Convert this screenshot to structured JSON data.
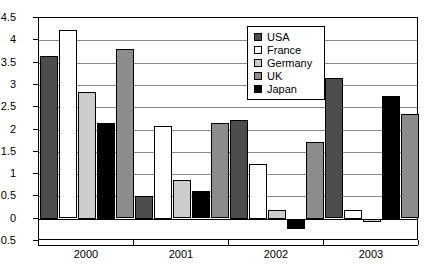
{
  "chart_data": {
    "type": "bar",
    "title": "",
    "subtitle": "",
    "xlabel": "",
    "ylabel": "",
    "categories": [
      "2000",
      "2001",
      "2002",
      "2003"
    ],
    "ylim": [
      -0.5,
      4.5
    ],
    "ytick_labels": [
      "4.5",
      "4",
      "3.5",
      "3",
      "2.5",
      "2",
      "1.5",
      "1",
      "0.5",
      "0",
      "-0.5"
    ],
    "ytick_values": [
      4.5,
      4,
      3.5,
      3,
      2.5,
      2,
      1.5,
      1,
      0.5,
      0,
      -0.5
    ],
    "grid": true,
    "legend_position": "top-right",
    "bar_order": [
      "USA",
      "France",
      "Germany",
      "Japan",
      "UK"
    ],
    "series": [
      {
        "name": "USA",
        "color": "#4d4d4d",
        "values": [
          3.65,
          0.52,
          2.21,
          3.15
        ]
      },
      {
        "name": "France",
        "color": "#ffffff",
        "values": [
          4.22,
          2.08,
          1.23,
          0.2
        ]
      },
      {
        "name": "Germany",
        "color": "#cccccc",
        "values": [
          2.85,
          0.86,
          0.2,
          -0.07
        ]
      },
      {
        "name": "UK",
        "color": "#8c8c8c",
        "values": [
          3.8,
          2.14,
          1.72,
          2.34
        ]
      },
      {
        "name": "Japan",
        "color": "#000000",
        "values": [
          2.15,
          0.61,
          -0.23,
          2.76
        ]
      }
    ]
  },
  "legend": {
    "items": [
      {
        "label": "USA",
        "color": "#4d4d4d"
      },
      {
        "label": "France",
        "color": "#ffffff"
      },
      {
        "label": "Germany",
        "color": "#cccccc"
      },
      {
        "label": "UK",
        "color": "#8c8c8c"
      },
      {
        "label": "Japan",
        "color": "#000000"
      }
    ]
  }
}
